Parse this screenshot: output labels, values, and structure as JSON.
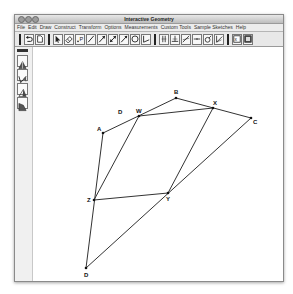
{
  "window": {
    "title": "Interactive Geometry"
  },
  "menubar": {
    "items": [
      "File",
      "Edit",
      "Draw",
      "Construct",
      "Transform",
      "Options",
      "Measurements",
      "Custom Tools",
      "Sample Sketches",
      "Help"
    ]
  },
  "toolbar": {
    "groups": [
      [
        "undo-icon",
        "document-icon"
      ],
      [
        "pointer-arrow-icon",
        "eraser-icon",
        "point-icon",
        "segment-icon",
        "ray-icon",
        "line-icon",
        "vector-icon",
        "circle-icon",
        "angle-icon"
      ],
      [
        "parallel-line-icon",
        "perpendicular-line-icon",
        "angle-bisector-icon",
        "midpoint-icon",
        "compass-icon",
        "reflect-icon"
      ],
      [
        "measure-icon",
        "calculator-icon"
      ]
    ]
  },
  "sidebar": {
    "tools": [
      "triangle-tool-icon",
      "angle-tool-icon",
      "triangle-bisect-icon",
      "polygon-tool-icon"
    ]
  },
  "sketch": {
    "points": {
      "A": {
        "x": 70,
        "y": 86,
        "label": "A"
      },
      "B": {
        "x": 143,
        "y": 51,
        "label": "B"
      },
      "C": {
        "x": 218,
        "y": 71,
        "label": "C"
      },
      "D": {
        "x": 53,
        "y": 221,
        "label": "D"
      },
      "W": {
        "x": 106,
        "y": 69,
        "label": "W"
      },
      "X": {
        "x": 180,
        "y": 61,
        "label": "X"
      },
      "Y": {
        "x": 135,
        "y": 146,
        "label": "Y"
      },
      "Z": {
        "x": 61,
        "y": 153,
        "label": "Z"
      }
    },
    "extra_labels": [
      {
        "text": "D",
        "x": 85,
        "y": 67
      }
    ],
    "quadrilateral": [
      "A",
      "B",
      "C",
      "D"
    ],
    "midpoint_parallelogram": [
      "W",
      "X",
      "Y",
      "Z"
    ],
    "line_color": "#333333"
  }
}
